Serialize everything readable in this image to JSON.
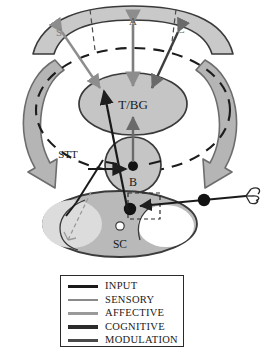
{
  "figure": {
    "regions": {
      "cortex_label_s": "S",
      "cortex_label_a": "A",
      "cortex_label_c": "C",
      "thalamus_basal_ganglia": "T/BG",
      "brainstem": "B",
      "spinal_cord": "SC",
      "spinothalamic_tract": "STT"
    }
  },
  "legend": {
    "items": [
      {
        "label": "INPUT",
        "color": "#1a1a1a"
      },
      {
        "label": "SENSORY",
        "color": "#8a8a8a"
      },
      {
        "label": "AFFECTIVE",
        "color": "#9a9a9a"
      },
      {
        "label": "COGNITIVE",
        "color": "#2b2b2b"
      },
      {
        "label": "MODULATION",
        "color": "#4a4a4a"
      }
    ]
  },
  "colors": {
    "fill_light_gray": "#c9c9c9",
    "fill_mid_gray": "#bdbdbd",
    "fill_pale": "#e2e2e2",
    "outline_dark": "#3a3a3a",
    "arrow_big_fill": "#b5b5b5",
    "arrow_big_stroke": "#6d6d6d",
    "white": "#ffffff"
  }
}
